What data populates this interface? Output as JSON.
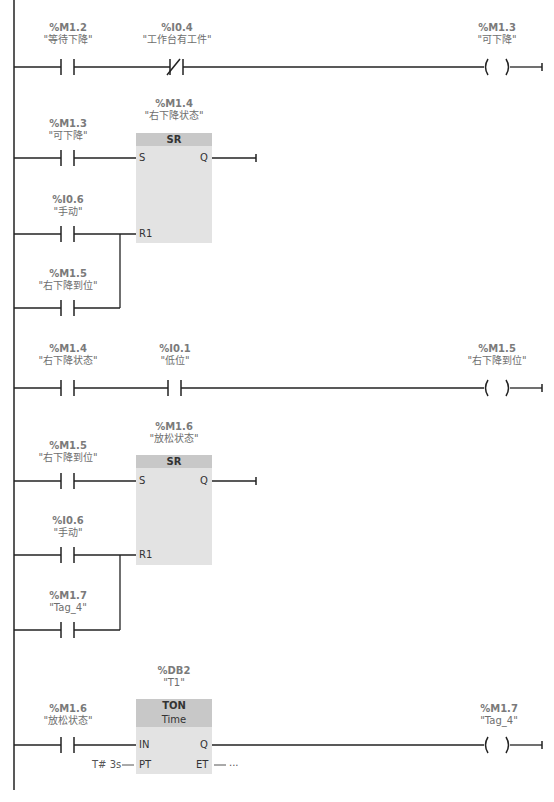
{
  "networks": [
    {
      "id": 1,
      "contacts": [
        {
          "type": "NO",
          "address": "%M1.2",
          "symbol": "\"等待下降\""
        },
        {
          "type": "NC",
          "address": "%I0.4",
          "symbol": "\"工作台有工件\""
        }
      ],
      "coil": {
        "address": "%M1.3",
        "symbol": "\"可下降\""
      }
    },
    {
      "id": 2,
      "block": {
        "type": "SR",
        "address": "%M1.4",
        "symbol": "\"右下降状态\"",
        "pins": {
          "s": "S",
          "r": "R1",
          "q": "Q"
        }
      },
      "set_contact": {
        "type": "NO",
        "address": "%M1.3",
        "symbol": "\"可下降\""
      },
      "reset_contacts": [
        {
          "type": "NO",
          "address": "%I0.6",
          "symbol": "\"手动\""
        },
        {
          "type": "NO",
          "address": "%M1.5",
          "symbol": "\"右下降到位\""
        }
      ]
    },
    {
      "id": 3,
      "contacts": [
        {
          "type": "NO",
          "address": "%M1.4",
          "symbol": "\"右下降状态\""
        },
        {
          "type": "NO",
          "address": "%I0.1",
          "symbol": "\"低位\""
        }
      ],
      "coil": {
        "address": "%M1.5",
        "symbol": "\"右下降到位\""
      }
    },
    {
      "id": 4,
      "block": {
        "type": "SR",
        "address": "%M1.6",
        "symbol": "\"放松状态\"",
        "pins": {
          "s": "S",
          "r": "R1",
          "q": "Q"
        }
      },
      "set_contact": {
        "type": "NO",
        "address": "%M1.5",
        "symbol": "\"右下降到位\""
      },
      "reset_contacts": [
        {
          "type": "NO",
          "address": "%I0.6",
          "symbol": "\"手动\""
        },
        {
          "type": "NO",
          "address": "%M1.7",
          "symbol": "\"Tag_4\""
        }
      ]
    },
    {
      "id": 5,
      "block": {
        "type": "TON",
        "subtype": "Time",
        "address": "%DB2",
        "symbol": "\"T1\"",
        "pins": {
          "in": "IN",
          "pt": "PT",
          "q": "Q",
          "et": "ET"
        },
        "pt_value": "T# 3s",
        "et_value": "..."
      },
      "contact": {
        "type": "NO",
        "address": "%M1.6",
        "symbol": "\"放松状态\""
      },
      "coil": {
        "address": "%M1.7",
        "symbol": "\"Tag_4\""
      }
    }
  ],
  "colors": {
    "wire": "#222222",
    "label": "#6e6e6e",
    "block_body": "#e3e3e3",
    "block_header": "#c8c8c8"
  }
}
